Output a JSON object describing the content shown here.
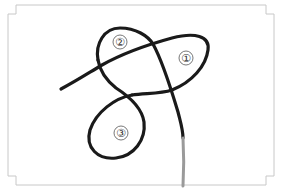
{
  "diagram": {
    "type": "knot-illustration",
    "frame": {
      "stroke": "#c8c8c8",
      "style": "notched-corner-rectangle"
    },
    "rope": {
      "color": "#1a1a1a",
      "tail_color": "#9a9a9a"
    },
    "labels": [
      {
        "id": "loop-1",
        "text": "①",
        "x": 186,
        "y": 58
      },
      {
        "id": "loop-2",
        "text": "②",
        "x": 120,
        "y": 42
      },
      {
        "id": "loop-3",
        "text": "③",
        "x": 121,
        "y": 133
      }
    ]
  }
}
